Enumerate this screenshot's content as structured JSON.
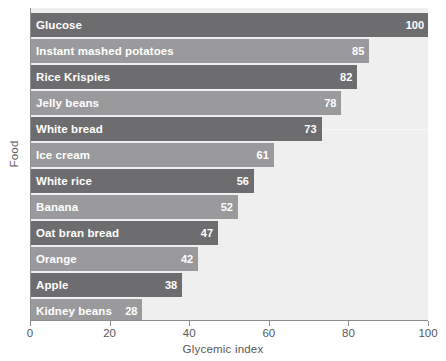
{
  "chart_data": {
    "type": "bar",
    "orientation": "horizontal",
    "title": "",
    "xlabel": "Glycemic index",
    "ylabel": "Food",
    "xlim": [
      0,
      100
    ],
    "xticks": [
      0,
      20,
      40,
      60,
      80,
      100
    ],
    "grid": false,
    "legend": null,
    "categories": [
      "Glucose",
      "Instant mashed potatoes",
      "Rice Krispies",
      "Jelly beans",
      "White bread",
      "Ice cream",
      "White rice",
      "Banana",
      "Oat bran bread",
      "Orange",
      "Apple",
      "Kidney beans"
    ],
    "values": [
      100,
      85,
      82,
      78,
      73,
      61,
      56,
      52,
      47,
      42,
      38,
      28
    ],
    "bar_colors": [
      "#6d6d6f",
      "#9a9a9c",
      "#6d6d6f",
      "#9a9a9c",
      "#6d6d6f",
      "#9a9a9c",
      "#6d6d6f",
      "#9a9a9c",
      "#6d6d6f",
      "#9a9a9c",
      "#6d6d6f",
      "#9a9a9c"
    ],
    "plot_background": "#efefef",
    "axis_color": "#8e8e90",
    "label_text_color": "#ffffff",
    "tick_text_color": "#58585a"
  }
}
